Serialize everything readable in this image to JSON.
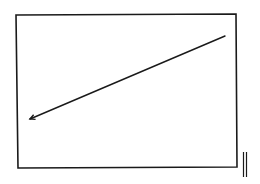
{
  "diagram": {
    "background": "#ffffff",
    "stroke_color": "#1a1a1a",
    "frame": {
      "points": [
        [
          16,
          15
        ],
        [
          236,
          14
        ],
        [
          237,
          167
        ],
        [
          18,
          168
        ]
      ],
      "stroke_width": 1.6
    },
    "arrow": {
      "from": [
        225,
        36
      ],
      "to": [
        30,
        119
      ],
      "stroke_width": 1.4,
      "head": "open-left"
    },
    "side_marks": {
      "lines": [
        {
          "x": 243.5,
          "y1": 152,
          "y2": 177
        },
        {
          "x": 246.5,
          "y1": 152,
          "y2": 177
        }
      ],
      "stroke_width": 1.2
    }
  }
}
